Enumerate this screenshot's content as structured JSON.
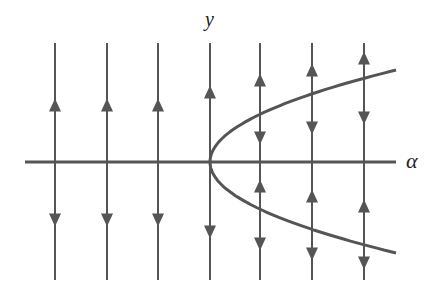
{
  "diagram": {
    "type": "bifurcation phase portrait (saddle-node)",
    "axes": {
      "horizontal_label": "α",
      "vertical_label": "y"
    },
    "colors": {
      "line": "#555555",
      "curve": "#555555",
      "axis": "#555555",
      "background": "#ffffff"
    },
    "geometry": {
      "axis_y": 162,
      "axis_x_start": 25,
      "axis_x_end": 396,
      "vertex_x": 210,
      "curve_end_x": 396,
      "curve_upper_end_y": 70,
      "curve_lower_end_y": 253,
      "line_top": 43,
      "line_bottom": 280
    },
    "flow_lines": [
      {
        "x": 55,
        "arrows": [
          {
            "y": 105,
            "dir": "up"
          },
          {
            "y": 220,
            "dir": "down"
          }
        ]
      },
      {
        "x": 107,
        "arrows": [
          {
            "y": 105,
            "dir": "up"
          },
          {
            "y": 220,
            "dir": "down"
          }
        ]
      },
      {
        "x": 158,
        "arrows": [
          {
            "y": 105,
            "dir": "up"
          },
          {
            "y": 220,
            "dir": "down"
          }
        ]
      },
      {
        "x": 210,
        "arrows": [
          {
            "y": 92,
            "dir": "up"
          },
          {
            "y": 232,
            "dir": "down"
          }
        ]
      },
      {
        "x": 260,
        "arrows": [
          {
            "y": 80,
            "dir": "up"
          },
          {
            "y": 138,
            "dir": "down"
          },
          {
            "y": 186,
            "dir": "up"
          },
          {
            "y": 244,
            "dir": "down"
          }
        ]
      },
      {
        "x": 312,
        "arrows": [
          {
            "y": 70,
            "dir": "up"
          },
          {
            "y": 128,
            "dir": "down"
          },
          {
            "y": 196,
            "dir": "up"
          },
          {
            "y": 254,
            "dir": "down"
          }
        ]
      },
      {
        "x": 364,
        "arrows": [
          {
            "y": 58,
            "dir": "up"
          },
          {
            "y": 118,
            "dir": "down"
          },
          {
            "y": 206,
            "dir": "up"
          },
          {
            "y": 263,
            "dir": "down"
          }
        ]
      }
    ]
  }
}
